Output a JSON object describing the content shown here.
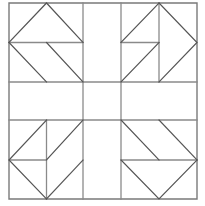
{
  "figure": {
    "canvas": {
      "width": 205,
      "height": 206,
      "background": "#ffffff"
    },
    "style": {
      "outline_color": "#7a7a7a",
      "grid_color": "#8a8a8a",
      "motif_color": "#555555",
      "outline_width": 1.4,
      "grid_width": 1.3,
      "motif_width": 1.2,
      "fill": "none"
    },
    "block": {
      "left": 9,
      "top": 3,
      "right": 197,
      "bottom": 199,
      "columns": [
        9,
        46.5,
        83,
        121,
        159,
        197
      ],
      "rows": [
        3,
        42.5,
        82,
        120,
        160,
        199
      ],
      "grid": "3x3 nine-patch with each corner patch split into two halves"
    },
    "grid_lines": {
      "vertical": [
        83,
        121
      ],
      "horizontal": [
        82,
        120
      ]
    },
    "cells": [
      {
        "name": "top-left-patch",
        "x": 9,
        "y": 3,
        "w": 74,
        "h": 79,
        "motif": "flying-geese-north"
      },
      {
        "name": "top-center-patch",
        "x": 83,
        "y": 3,
        "w": 38,
        "h": 79,
        "motif": "empty"
      },
      {
        "name": "top-right-patch",
        "x": 121,
        "y": 3,
        "w": 76,
        "h": 79,
        "motif": "flying-geese-east"
      },
      {
        "name": "middle-left-patch",
        "x": 9,
        "y": 82,
        "w": 74,
        "h": 38,
        "motif": "empty"
      },
      {
        "name": "center-patch",
        "x": 83,
        "y": 82,
        "w": 38,
        "h": 38,
        "motif": "empty"
      },
      {
        "name": "middle-right-patch",
        "x": 121,
        "y": 82,
        "w": 76,
        "h": 38,
        "motif": "empty"
      },
      {
        "name": "bottom-left-patch",
        "x": 9,
        "y": 120,
        "w": 74,
        "h": 79,
        "motif": "flying-geese-west"
      },
      {
        "name": "bottom-center-patch",
        "x": 83,
        "y": 120,
        "w": 38,
        "h": 79,
        "motif": "empty"
      },
      {
        "name": "bottom-right-patch",
        "x": 121,
        "y": 120,
        "w": 76,
        "h": 79,
        "motif": "flying-geese-south"
      }
    ],
    "paths": {
      "outer_frame": "M9,3 H197 V199 H9 Z",
      "grid_v1": "M83,3 V199",
      "grid_v2": "M121,3 V199",
      "grid_h1": "M9,82 H197",
      "grid_h2": "M9,120 H197",
      "tl_divider": "M9,42.5 H83",
      "tl_triangle": "M9,42.5 L46.5,3 L83,42.5",
      "tl_diag_a": "M9,42.5 L46.5,82",
      "tl_diag_b": "M46.5,42.5 L83,82",
      "tr_divider": "M159,3 V82",
      "tr_half_line": "M121,42.5 H159",
      "tr_diag_a": "M121,42.5 L159,3",
      "tr_diag_b": "M121,82 L159,42.5",
      "tr_triangle": "M159,3 L197,42.5 L159,82",
      "bl_divider": "M46.5,120 V199",
      "bl_half_line": "M9,160 H46.5",
      "bl_triangle": "M46.5,120 L9,160 L46.5,199",
      "bl_diag_a": "M46.5,160 L83,120",
      "bl_diag_b": "M46.5,199 L83,160",
      "br_divider": "M121,160 H197",
      "br_diag_a": "M121,120 L159,160",
      "br_diag_b": "M159,120 L197,160",
      "br_triangle": "M121,160 L159,199 L197,160"
    }
  }
}
